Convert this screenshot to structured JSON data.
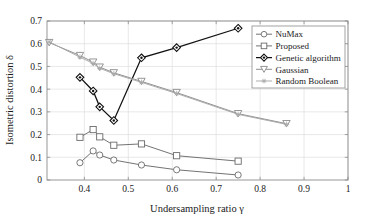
{
  "chart_data": {
    "type": "line",
    "title": "",
    "xlabel": "Undersampling ratio γ",
    "ylabel": "Isometric distortion δ",
    "xlim": [
      0.315,
      1.0
    ],
    "ylim": [
      0,
      0.7
    ],
    "grid": true,
    "legend_position": "top-right",
    "xticks": [
      "0.4",
      "0.5",
      "0.6",
      "0.7",
      "0.8",
      "0.9",
      "1"
    ],
    "xtick_values": [
      0.4,
      0.5,
      0.6,
      0.7,
      0.8,
      0.9,
      1.0
    ],
    "yticks": [
      "0",
      "0.1",
      "0.2",
      "0.3",
      "0.4",
      "0.5",
      "0.6",
      "0.7"
    ],
    "ytick_values": [
      0,
      0.1,
      0.2,
      0.3,
      0.4,
      0.5,
      0.6,
      0.7
    ],
    "series": [
      {
        "name": "NuMax",
        "marker": "circle",
        "color": "#6b6b6b",
        "x": [
          0.39,
          0.42,
          0.435,
          0.467,
          0.53,
          0.61,
          0.75
        ],
        "y": [
          0.076,
          0.128,
          0.11,
          0.088,
          0.066,
          0.045,
          0.022
        ]
      },
      {
        "name": "Proposed",
        "marker": "square",
        "color": "#6b6b6b",
        "x": [
          0.39,
          0.42,
          0.435,
          0.467,
          0.53,
          0.61,
          0.75
        ],
        "y": [
          0.188,
          0.222,
          0.19,
          0.153,
          0.159,
          0.107,
          0.083
        ]
      },
      {
        "name": "Genetic algorithm",
        "marker": "diamond",
        "color": "#111111",
        "x": [
          0.39,
          0.42,
          0.435,
          0.467,
          0.53,
          0.61,
          0.75
        ],
        "y": [
          0.452,
          0.392,
          0.322,
          0.262,
          0.538,
          0.583,
          0.668
        ]
      },
      {
        "name": "Gaussian",
        "marker": "triangle-down",
        "color": "#8a8a8a",
        "x": [
          0.32,
          0.39,
          0.42,
          0.435,
          0.467,
          0.53,
          0.61,
          0.75,
          0.86
        ],
        "y": [
          0.605,
          0.548,
          0.519,
          0.497,
          0.472,
          0.434,
          0.385,
          0.292,
          0.248
        ]
      },
      {
        "name": "Random Boolean",
        "marker": "star",
        "color": "#a8a8a8",
        "x": [
          0.32,
          0.39,
          0.42,
          0.435,
          0.467,
          0.53,
          0.61,
          0.75,
          0.86
        ],
        "y": [
          0.608,
          0.541,
          0.513,
          0.492,
          0.468,
          0.43,
          0.381,
          0.289,
          0.245
        ]
      }
    ]
  }
}
